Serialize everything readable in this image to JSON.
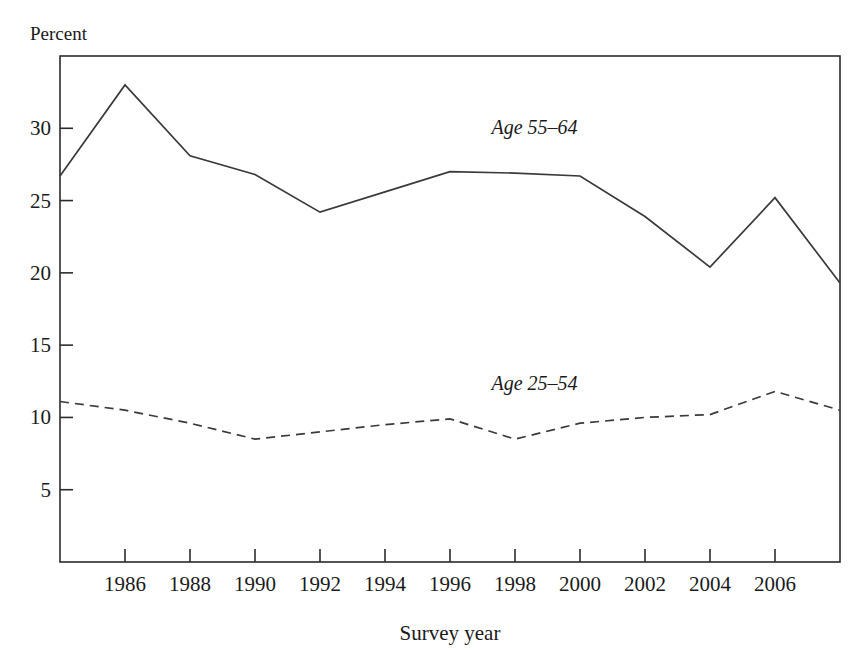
{
  "chart_data": {
    "type": "line",
    "title": "",
    "xlabel": "Survey year",
    "ylabel": "Percent",
    "x": [
      1984,
      1986,
      1988,
      1990,
      1992,
      1994,
      1996,
      1998,
      2000,
      2002,
      2004,
      2006,
      2008
    ],
    "xlim": [
      1984,
      2008
    ],
    "ylim": [
      0,
      35
    ],
    "xticks": [
      1986,
      1988,
      1990,
      1992,
      1994,
      1996,
      1998,
      2000,
      2002,
      2004,
      2006
    ],
    "xtick_labels": [
      "1986",
      "1988",
      "1990",
      "1992",
      "1994",
      "1996",
      "1998",
      "2000",
      "2002",
      "2004",
      "2006"
    ],
    "yticks": [
      5,
      10,
      15,
      20,
      25,
      30
    ],
    "ytick_labels": [
      "5",
      "10",
      "15",
      "20",
      "25",
      "30"
    ],
    "grid": false,
    "legend_position": "inline-annotation",
    "series": [
      {
        "name": "Age 55–64",
        "style": "solid",
        "color": "#3a3a3a",
        "values": [
          26.7,
          33.0,
          28.1,
          26.8,
          24.2,
          25.6,
          27.0,
          26.9,
          26.7,
          23.9,
          20.4,
          25.2,
          19.3
        ]
      },
      {
        "name": "Age 25–54",
        "style": "dashed",
        "color": "#3a3a3a",
        "values": [
          11.1,
          10.5,
          9.6,
          8.5,
          9.0,
          9.5,
          9.9,
          8.5,
          9.6,
          10.0,
          10.2,
          11.8,
          10.5
        ]
      }
    ],
    "annotations": [
      {
        "text": "Age 55–64",
        "x": 1998.6,
        "y": 29.6
      },
      {
        "text": "Age 25–54",
        "x": 1998.6,
        "y": 11.9
      }
    ]
  },
  "geometry": {
    "plot_left": 60,
    "plot_right": 840,
    "plot_top": 56,
    "plot_bottom": 562,
    "tick_length": 13
  }
}
